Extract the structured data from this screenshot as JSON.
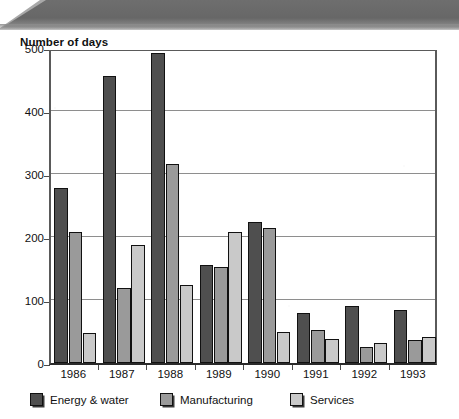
{
  "chart_data": {
    "type": "bar",
    "title": "Number of days",
    "xlabel": "",
    "ylabel": "Number of days",
    "categories": [
      "1986",
      "1987",
      "1988",
      "1989",
      "1990",
      "1991",
      "1992",
      "1993"
    ],
    "series": [
      {
        "name": "Energy & water",
        "color": "#4f4f4f",
        "values": [
          278,
          455,
          492,
          156,
          224,
          80,
          90,
          84
        ]
      },
      {
        "name": "Manufacturing",
        "color": "#9a9a9a",
        "values": [
          208,
          119,
          316,
          153,
          214,
          52,
          26,
          36
        ]
      },
      {
        "name": "Services",
        "color": "#c9c9c9",
        "values": [
          48,
          187,
          124,
          208,
          50,
          38,
          32,
          42
        ]
      }
    ],
    "ylim": [
      0,
      500
    ],
    "yticks": [
      0,
      100,
      200,
      300,
      400,
      500
    ],
    "ytick_labels": [
      "0",
      "100",
      "200",
      "300",
      "400",
      "500"
    ],
    "grid": true,
    "legend_position": "bottom"
  },
  "legend": {
    "items": [
      {
        "label": "Energy & water",
        "swatch": "legend-swatch-energy-water"
      },
      {
        "label": "Manufacturing",
        "swatch": "legend-swatch-manufacturing"
      },
      {
        "label": "Services",
        "swatch": "legend-swatch-services"
      }
    ]
  }
}
